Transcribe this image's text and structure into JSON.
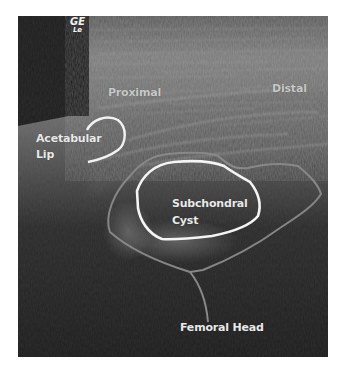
{
  "image": {
    "type": "ultrasound",
    "logo": {
      "line1": "GE",
      "line2": "Le"
    },
    "labels": {
      "proximal": "Proximal",
      "distal": "Distal",
      "acetabular_line1": "Acetabular",
      "acetabular_line2": "Lip",
      "cyst_line1": "Subchondral",
      "cyst_line2": "Cyst",
      "femoral_head": "Femoral Head"
    },
    "colors": {
      "background": "#ffffff",
      "image_dark": "#1e1e1e",
      "tissue_gray": "#6a6a6a",
      "outline_white": "#f4f4f4",
      "outline_gray": "#8a8a8a",
      "label_text": "#e9e9e9"
    }
  }
}
